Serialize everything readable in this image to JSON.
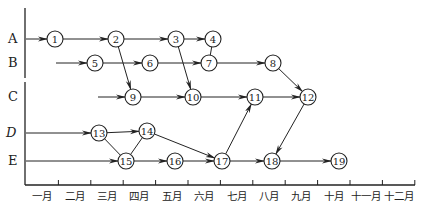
{
  "diagram": {
    "type": "network-schedule",
    "rows": [
      {
        "id": "A",
        "label": "A",
        "y": 39
      },
      {
        "id": "B",
        "label": "B",
        "y": 63
      },
      {
        "id": "C",
        "label": "C",
        "y": 97
      },
      {
        "id": "D",
        "label": "D",
        "y": 133
      },
      {
        "id": "E",
        "label": "E",
        "y": 161
      }
    ],
    "months": [
      "一月",
      "二月",
      "三月",
      "四月",
      "五月",
      "六月",
      "七月",
      "八月",
      "九月",
      "十月",
      "十一月",
      "十二月"
    ],
    "nodes": [
      {
        "id": "1",
        "label": "1",
        "x": 55,
        "y": 39
      },
      {
        "id": "2",
        "label": "2",
        "x": 116,
        "y": 39
      },
      {
        "id": "3",
        "label": "3",
        "x": 176,
        "y": 39
      },
      {
        "id": "4",
        "label": "4",
        "x": 213,
        "y": 39
      },
      {
        "id": "5",
        "label": "5",
        "x": 95,
        "y": 63
      },
      {
        "id": "6",
        "label": "6",
        "x": 150,
        "y": 63
      },
      {
        "id": "7",
        "label": "7",
        "x": 209,
        "y": 63
      },
      {
        "id": "8",
        "label": "8",
        "x": 273,
        "y": 63
      },
      {
        "id": "9",
        "label": "9",
        "x": 133,
        "y": 97
      },
      {
        "id": "10",
        "label": "10",
        "x": 193,
        "y": 97
      },
      {
        "id": "11",
        "label": "11",
        "x": 255,
        "y": 97
      },
      {
        "id": "12",
        "label": "12",
        "x": 308,
        "y": 97
      },
      {
        "id": "13",
        "label": "13",
        "x": 99,
        "y": 133
      },
      {
        "id": "14",
        "label": "14",
        "x": 147,
        "y": 131
      },
      {
        "id": "15",
        "label": "15",
        "x": 126,
        "y": 161
      },
      {
        "id": "16",
        "label": "16",
        "x": 175,
        "y": 161
      },
      {
        "id": "17",
        "label": "17",
        "x": 222,
        "y": 161
      },
      {
        "id": "18",
        "label": "18",
        "x": 272,
        "y": 161
      },
      {
        "id": "19",
        "label": "19",
        "x": 339,
        "y": 161
      }
    ],
    "edges": [
      {
        "from": "A-start",
        "to": "1",
        "arrow": true
      },
      {
        "from": "1",
        "to": "2",
        "arrow": true
      },
      {
        "from": "2",
        "to": "3",
        "arrow": true
      },
      {
        "from": "3",
        "to": "4",
        "arrow": true
      },
      {
        "from": "4",
        "to": "7",
        "arrow": false
      },
      {
        "from": "B-start",
        "to": "5",
        "arrow": true
      },
      {
        "from": "5",
        "to": "6",
        "arrow": true
      },
      {
        "from": "6",
        "to": "7",
        "arrow": true
      },
      {
        "from": "7",
        "to": "8",
        "arrow": true
      },
      {
        "from": "2",
        "to": "9",
        "arrow": true
      },
      {
        "from": "3",
        "to": "10",
        "arrow": true
      },
      {
        "from": "8",
        "to": "12",
        "arrow": true
      },
      {
        "from": "C-start",
        "to": "9",
        "arrow": true
      },
      {
        "from": "9",
        "to": "10",
        "arrow": true
      },
      {
        "from": "10",
        "to": "11",
        "arrow": true
      },
      {
        "from": "11",
        "to": "12",
        "arrow": true
      },
      {
        "from": "D-start",
        "to": "13",
        "arrow": true
      },
      {
        "from": "13",
        "to": "14",
        "arrow": true
      },
      {
        "from": "13",
        "to": "15",
        "arrow": false
      },
      {
        "from": "15",
        "to": "14",
        "arrow": false
      },
      {
        "from": "14",
        "to": "17",
        "arrow": true
      },
      {
        "from": "E-start",
        "to": "15",
        "arrow": true
      },
      {
        "from": "15",
        "to": "16",
        "arrow": true
      },
      {
        "from": "16",
        "to": "17",
        "arrow": true
      },
      {
        "from": "17",
        "to": "11",
        "arrow": true
      },
      {
        "from": "17",
        "to": "18",
        "arrow": true
      },
      {
        "from": "12",
        "to": "18",
        "arrow": true
      },
      {
        "from": "18",
        "to": "19",
        "arrow": true
      }
    ]
  }
}
